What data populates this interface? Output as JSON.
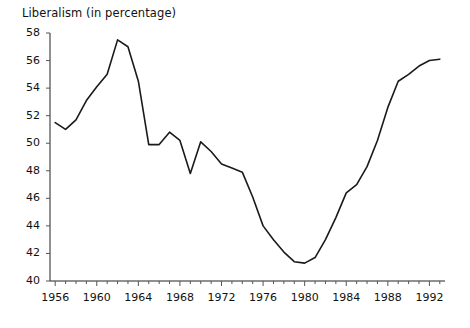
{
  "chart_data": {
    "type": "line",
    "title": "Liberalism (in percentage)",
    "xlabel": "",
    "ylabel": "",
    "ylim": [
      40,
      58
    ],
    "xlim": [
      1955.5,
      1993.5
    ],
    "grid": false,
    "legend": "none",
    "y_ticks": [
      40,
      42,
      44,
      46,
      48,
      50,
      52,
      54,
      56,
      58
    ],
    "y_tick_labels": [
      "40",
      "42",
      "44",
      "46",
      "48",
      "50",
      "52",
      "54",
      "56",
      "58"
    ],
    "x_ticks": [
      1956,
      1960,
      1964,
      1968,
      1972,
      1976,
      1980,
      1984,
      1988,
      1992
    ],
    "x_tick_labels": [
      "1956",
      "1960",
      "1964",
      "1968",
      "1972",
      "1976",
      "1980",
      "1984",
      "1988",
      "1992"
    ],
    "x_minor_tick_interval": 1,
    "series": [
      {
        "name": "Liberalism",
        "color": "#1a1a1a",
        "line_width": 1.6,
        "x": [
          1956,
          1957,
          1958,
          1959,
          1960,
          1961,
          1962,
          1963,
          1964,
          1965,
          1966,
          1967,
          1968,
          1969,
          1970,
          1971,
          1972,
          1973,
          1974,
          1975,
          1976,
          1977,
          1978,
          1979,
          1980,
          1981,
          1982,
          1983,
          1984,
          1985,
          1986,
          1987,
          1988,
          1989,
          1990,
          1991,
          1992,
          1993
        ],
        "values": [
          51.5,
          51.0,
          51.7,
          53.1,
          54.1,
          55.0,
          57.5,
          57.0,
          54.5,
          49.9,
          49.9,
          50.8,
          50.2,
          47.8,
          50.1,
          49.4,
          48.5,
          48.2,
          47.9,
          46.1,
          44.0,
          43.0,
          42.1,
          41.4,
          41.3,
          41.7,
          43.0,
          44.6,
          46.4,
          47.0,
          48.3,
          50.2,
          52.6,
          54.5,
          55.0,
          55.6,
          56.0,
          56.1
        ]
      }
    ]
  },
  "axes": {
    "axis_color": "#222222",
    "tick_color": "#555555",
    "title_color": "#111111"
  }
}
